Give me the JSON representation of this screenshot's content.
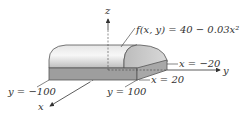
{
  "figure": {
    "axes": {
      "z_label": "z",
      "y_label": "y",
      "x_label": "x"
    },
    "function_label": "f(x, y) = 40 − 0.03x²",
    "boundaries": {
      "x_neg": "x = −20",
      "x_pos": "x = 20",
      "y_neg": "y = −100",
      "y_pos": "y = 100"
    },
    "colors": {
      "top_surface_light": "#f2f2f2",
      "top_surface_dark": "#b8b8b8",
      "front_face": "#9a9a9a",
      "end_face": "#cfcfcf",
      "outline": "#555555",
      "axis": "#333333"
    }
  }
}
